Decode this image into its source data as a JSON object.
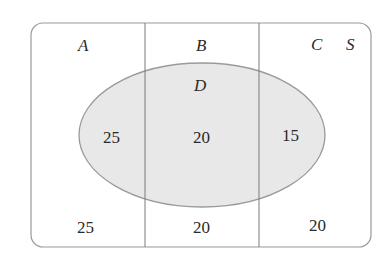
{
  "diagram": {
    "type": "venn",
    "universal_set_label": "S",
    "partitions": [
      {
        "label": "A"
      },
      {
        "label": "B"
      },
      {
        "label": "C"
      }
    ],
    "overlay_set_label": "D",
    "regions": {
      "A_and_D": "25",
      "B_and_D": "20",
      "C_and_D": "15",
      "A_not_D": "25",
      "B_not_D": "20",
      "C_not_D": "20"
    },
    "colors": {
      "border": "#9a9a9a",
      "ellipse_fill": "#e8e8e8",
      "ellipse_stroke": "#9a9a9a",
      "text": "#2a2a2a"
    }
  }
}
